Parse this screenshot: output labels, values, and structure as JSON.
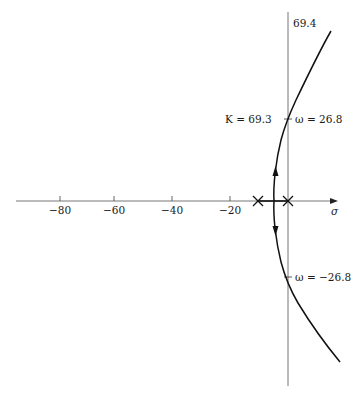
{
  "diagram": {
    "type": "root-locus",
    "axes": {
      "real_axis_label": "σ",
      "imag_top_label": "69.4",
      "real_ticks": [
        {
          "value": -80,
          "label": "−80",
          "x": 60
        },
        {
          "value": -60,
          "label": "−60",
          "x": 114
        },
        {
          "value": -40,
          "label": "−40",
          "x": 172
        },
        {
          "value": -20,
          "label": "−20",
          "x": 230
        }
      ]
    },
    "poles": [
      {
        "label": "pole-1",
        "real": -10,
        "imag": 0
      },
      {
        "label": "pole-2",
        "real": 0,
        "imag": 0
      }
    ],
    "annotations": {
      "upper_crossing_gain": "K = 69.3",
      "upper_crossing_freq": "ω = 26.8",
      "lower_crossing_freq": "ω = −26.8"
    },
    "colors": {
      "locus": "#111111",
      "axis": "#555555"
    }
  }
}
